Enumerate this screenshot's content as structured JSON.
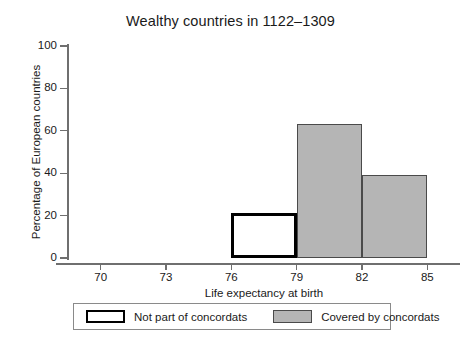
{
  "chart_data": {
    "type": "bar",
    "title": "Wealthy countries in 1122–1309",
    "xlabel": "Life expectancy at birth",
    "ylabel": "Percentage of European countries",
    "xlim": [
      68.5,
      86.5
    ],
    "ylim": [
      0,
      100
    ],
    "grid": false,
    "bar_style": "histogram",
    "xticks": [
      70,
      73,
      76,
      79,
      82,
      85
    ],
    "xtick_labels": [
      "70",
      "73",
      "76",
      "79",
      "82",
      "85"
    ],
    "yticks": [
      0,
      20,
      40,
      60,
      80,
      100
    ],
    "ytick_labels": [
      "0",
      "20",
      "40",
      "60",
      "80",
      "100"
    ],
    "bins": [
      {
        "x_start": 76,
        "x_end": 79,
        "value": 21,
        "series": "Not part of concordats",
        "style": "outlined"
      },
      {
        "x_start": 79,
        "x_end": 82,
        "value": 63,
        "series": "Covered by concordats",
        "style": "filled"
      },
      {
        "x_start": 82,
        "x_end": 85,
        "value": 39,
        "series": "Covered by concordats",
        "style": "filled"
      }
    ],
    "series": [
      {
        "name": "Not part of concordats",
        "style": "outlined",
        "fill": "#ffffff",
        "edge": "#000000",
        "values": [
          21
        ]
      },
      {
        "name": "Covered by concordats",
        "style": "filled",
        "fill": "#b5b5b5",
        "edge": "#4a4a4a",
        "values": [
          63,
          38
        ]
      }
    ],
    "legend": {
      "position": "below-axes",
      "entries": [
        {
          "label": "Not part of concordats",
          "style": "outlined"
        },
        {
          "label": "Covered by concordats",
          "style": "filled"
        }
      ]
    },
    "colors": {
      "bar_fill_gray": "#b5b5b5",
      "bar_edge_gray": "#4a4a4a",
      "bar_outline_black": "#000000",
      "axis_line": "#6f6f6f",
      "background": "#ffffff",
      "text": "#1a1a1a"
    }
  }
}
